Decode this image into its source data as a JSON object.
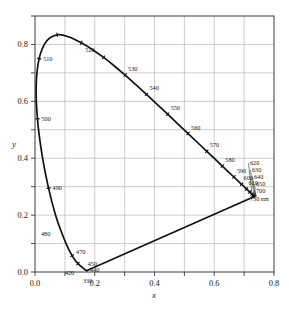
{
  "figure": {
    "background_color": "#ffffff",
    "curve_color": "#111111",
    "grid_color": "#b9b9b9",
    "frame_color": "#3a3a3a"
  },
  "chart_data": {
    "type": "line",
    "title": "",
    "xlabel": "x",
    "ylabel": "y",
    "xlim": [
      0.0,
      0.8
    ],
    "ylim": [
      0.0,
      0.9
    ],
    "xticks": [
      "0.0",
      "0.2",
      "0.4",
      "0.6",
      "0.8"
    ],
    "xtick_values": [
      0.0,
      0.2,
      0.4,
      0.6,
      0.8
    ],
    "yticks": [
      "0.0",
      "0.2",
      "0.4",
      "0.6",
      "0.8"
    ],
    "ytick_values": [
      0.0,
      0.2,
      0.4,
      0.6,
      0.8
    ],
    "grid": true,
    "grid_spacing": 0.1,
    "legend": "none",
    "series": [
      {
        "name": "spectral locus",
        "x": [
          0.1741,
          0.174,
          0.1738,
          0.1736,
          0.1733,
          0.173,
          0.1726,
          0.1721,
          0.1714,
          0.1703,
          0.1689,
          0.1669,
          0.1644,
          0.1611,
          0.1566,
          0.151,
          0.144,
          0.1355,
          0.1241,
          0.1096,
          0.0913,
          0.0687,
          0.0454,
          0.0235,
          0.0082,
          0.0039,
          0.0139,
          0.0389,
          0.0743,
          0.1142,
          0.1547,
          0.1929,
          0.2296,
          0.2658,
          0.3016,
          0.3373,
          0.3731,
          0.4087,
          0.4441,
          0.4788,
          0.5125,
          0.5448,
          0.5752,
          0.6029,
          0.627,
          0.6482,
          0.6658,
          0.6801,
          0.6915,
          0.7006,
          0.7079,
          0.714,
          0.719,
          0.723,
          0.726,
          0.7283,
          0.73,
          0.7311,
          0.732,
          0.7327,
          0.7334,
          0.734,
          0.7344,
          0.7346,
          0.7347
        ],
        "y": [
          0.005,
          0.005,
          0.0049,
          0.0049,
          0.0048,
          0.0048,
          0.0048,
          0.0048,
          0.0051,
          0.0058,
          0.0069,
          0.0086,
          0.0109,
          0.0138,
          0.0177,
          0.0227,
          0.0297,
          0.0399,
          0.0578,
          0.0868,
          0.1327,
          0.2007,
          0.295,
          0.4127,
          0.5384,
          0.6548,
          0.7502,
          0.812,
          0.8338,
          0.8262,
          0.8059,
          0.7816,
          0.7543,
          0.7243,
          0.6923,
          0.6589,
          0.6245,
          0.5896,
          0.5547,
          0.5202,
          0.4866,
          0.4544,
          0.4242,
          0.3965,
          0.3725,
          0.3514,
          0.334,
          0.3197,
          0.3083,
          0.2993,
          0.292,
          0.2859,
          0.2809,
          0.277,
          0.274,
          0.2717,
          0.27,
          0.2689,
          0.268,
          0.2673,
          0.2666,
          0.266,
          0.2656,
          0.2654,
          0.2653
        ],
        "wavelengths_nm": [
          360,
          365,
          370,
          375,
          380,
          385,
          390,
          395,
          400,
          405,
          410,
          415,
          420,
          425,
          430,
          435,
          440,
          445,
          450,
          455,
          460,
          465,
          470,
          475,
          480,
          485,
          490,
          495,
          500,
          505,
          510,
          515,
          520,
          525,
          530,
          535,
          540,
          545,
          550,
          555,
          560,
          565,
          570,
          575,
          580,
          585,
          590,
          595,
          600,
          605,
          610,
          615,
          620,
          625,
          630,
          635,
          640,
          645,
          650,
          655,
          660,
          665,
          670,
          675,
          680
        ]
      },
      {
        "name": "line of purples",
        "x": [
          0.1741,
          0.7347
        ],
        "y": [
          0.005,
          0.2653
        ]
      }
    ],
    "annotations": [
      {
        "label": "520",
        "wavelength_nm": 520,
        "x": 0.2296,
        "y": 0.7543,
        "dx": -9,
        "dy": -5
      },
      {
        "label": "530",
        "wavelength_nm": 530,
        "x": 0.3016,
        "y": 0.6923,
        "dx": 3,
        "dy": -4
      },
      {
        "label": "540",
        "wavelength_nm": 540,
        "x": 0.3731,
        "y": 0.6245,
        "dx": 3,
        "dy": -4
      },
      {
        "label": "550",
        "wavelength_nm": 550,
        "x": 0.4441,
        "y": 0.5547,
        "dx": 3,
        "dy": -4
      },
      {
        "label": "560",
        "wavelength_nm": 560,
        "x": 0.5125,
        "y": 0.4866,
        "dx": 3,
        "dy": -4
      },
      {
        "label": "570",
        "wavelength_nm": 570,
        "x": 0.5752,
        "y": 0.4242,
        "dx": 3,
        "dy": -4
      },
      {
        "label": "580",
        "wavelength_nm": 580,
        "x": 0.627,
        "y": 0.3725,
        "dx": 3,
        "dy": -4
      },
      {
        "label": "590",
        "wavelength_nm": 590,
        "x": 0.6658,
        "y": 0.334,
        "dx": 3,
        "dy": -4
      },
      {
        "label": "600",
        "wavelength_nm": 600,
        "x": 0.6915,
        "y": 0.3083,
        "dx": 2,
        "dy": -4
      },
      {
        "label": "610",
        "wavelength_nm": 610,
        "x": 0.7079,
        "y": 0.292,
        "dx": 2,
        "dy": -4
      },
      {
        "label": "620",
        "wavelength_nm": 620,
        "x": 0.719,
        "y": 0.2809,
        "dx": 0,
        "dy": 0
      },
      {
        "label": "630",
        "wavelength_nm": 630,
        "x": 0.726,
        "y": 0.274,
        "dx": 0,
        "dy": 0
      },
      {
        "label": "640",
        "wavelength_nm": 640,
        "x": 0.73,
        "y": 0.27,
        "dx": 0,
        "dy": 0
      },
      {
        "label": "650",
        "wavelength_nm": 650,
        "x": 0.732,
        "y": 0.268,
        "dx": 0,
        "dy": 0
      },
      {
        "label": "700",
        "wavelength_nm": 700,
        "x": 0.7347,
        "y": 0.2653,
        "dx": 0,
        "dy": 0
      },
      {
        "label": "730 nm",
        "wavelength_nm": 730,
        "x": 0.7347,
        "y": 0.2653,
        "dx": 0,
        "dy": 0
      },
      {
        "label": "510",
        "wavelength_nm": 510,
        "x": 0.0139,
        "y": 0.7502,
        "dx": 4,
        "dy": 2
      },
      {
        "label": "500",
        "wavelength_nm": 500,
        "x": 0.0082,
        "y": 0.5384,
        "dx": 4,
        "dy": 2
      },
      {
        "label": "490",
        "wavelength_nm": 490,
        "x": 0.0454,
        "y": 0.295,
        "dx": 4,
        "dy": 2
      },
      {
        "label": "480",
        "wavelength_nm": 480,
        "x": 0.0913,
        "y": 0.1327,
        "dx": -12,
        "dy": 2
      },
      {
        "label": "470",
        "wavelength_nm": 470,
        "x": 0.1241,
        "y": 0.0578,
        "dx": 4,
        "dy": -2
      },
      {
        "label": "450",
        "wavelength_nm": 450,
        "x": 0.1566,
        "y": 0.0177,
        "dx": 6,
        "dy": -1
      },
      {
        "label": "440",
        "wavelength_nm": 440,
        "x": 0.1644,
        "y": 0.0109,
        "dx": 6,
        "dy": 3
      },
      {
        "label": "420",
        "wavelength_nm": 420,
        "x": 0.1714,
        "y": 0.0051,
        "dx": -12,
        "dy": 4
      },
      {
        "label": "330",
        "wavelength_nm": 330,
        "x": 0.1741,
        "y": 0.005,
        "dx": -4,
        "dy": 12
      }
    ],
    "locus_tick_wavelengths": [
      440,
      450,
      470,
      480,
      490,
      500,
      510,
      520,
      530,
      540,
      550,
      560,
      570,
      580,
      590,
      600,
      610,
      620,
      630,
      640,
      650,
      700
    ]
  },
  "axes": {
    "x_axis_label": "x",
    "y_axis_label": "y",
    "x_tick_labels": [
      "0.0",
      "0.2",
      "0.4",
      "0.6",
      "0.8"
    ],
    "y_tick_labels": [
      "0.0",
      "0.2",
      "0.4",
      "0.6",
      "0.8"
    ]
  }
}
